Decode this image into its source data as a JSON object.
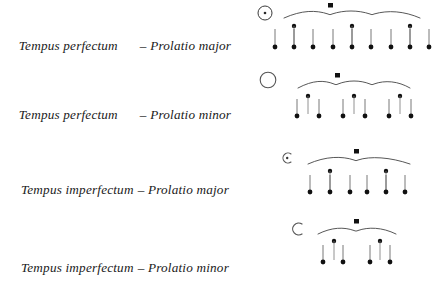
{
  "page": {
    "background": "#ffffff",
    "ink": "#1a1a1a",
    "width": 444,
    "height": 293
  },
  "rows": [
    {
      "id": "tempus-perfectum-prolatio-major",
      "label": {
        "lead": "Tempus perfectum",
        "dash": "–",
        "tail": "Prolatio major",
        "full": "Tempus perfectum  – Prolatio major",
        "spacing": "wide"
      },
      "sign": {
        "name": "circle-with-dot-sign",
        "glyph": "⊙",
        "description": "circle with central dot",
        "circle": true,
        "dot": true,
        "open": false
      },
      "tree": {
        "top_note": "square-breve",
        "level2_count": 3,
        "level3_per_branch": 3,
        "total_minims": 9,
        "division": "3 × 3"
      }
    },
    {
      "id": "tempus-perfectum-prolatio-minor",
      "label": {
        "lead": "Tempus perfectum",
        "dash": "–",
        "tail": "Prolatio minor",
        "full": "Tempus perfectum  – Prolatio minor",
        "spacing": "wide"
      },
      "sign": {
        "name": "circle-sign",
        "glyph": "○",
        "description": "empty circle",
        "circle": true,
        "dot": false,
        "open": false
      },
      "tree": {
        "top_note": "square-breve",
        "level2_count": 3,
        "level3_per_branch": 2,
        "total_minims": 6,
        "division": "3 × 2"
      }
    },
    {
      "id": "tempus-imperfectum-prolatio-major",
      "label": {
        "lead": "Tempus imperfectum",
        "dash": "–",
        "tail": "Prolatio major",
        "full": "Tempus imperfectum – Prolatio major",
        "spacing": "narrow"
      },
      "sign": {
        "name": "c-with-dot-sign",
        "glyph": "Ↄ",
        "description": "half circle (C) with central dot",
        "circle": false,
        "dot": true,
        "open": true
      },
      "tree": {
        "top_note": "square-breve",
        "level2_count": 2,
        "level3_per_branch": 3,
        "total_minims": 6,
        "division": "2 × 3"
      }
    },
    {
      "id": "tempus-imperfectum-prolatio-minor",
      "label": {
        "lead": "Tempus imperfectum",
        "dash": "–",
        "tail": "Prolatio minor",
        "full": "Tempus imperfectum – Prolatio minor",
        "spacing": "narrow"
      },
      "sign": {
        "name": "c-sign",
        "glyph": "C",
        "description": "half circle (C)",
        "circle": false,
        "dot": false,
        "open": true
      },
      "tree": {
        "top_note": "square-breve",
        "level2_count": 2,
        "level3_per_branch": 2,
        "total_minims": 4,
        "division": "2 × 2"
      }
    }
  ]
}
